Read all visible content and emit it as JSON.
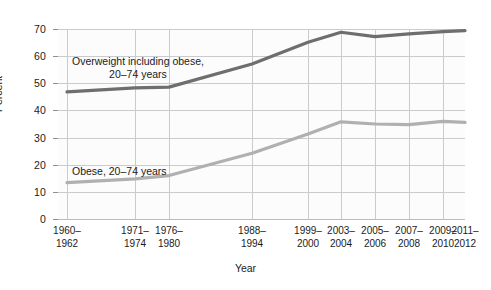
{
  "chart_data": {
    "type": "line",
    "title": "",
    "xlabel": "Year",
    "ylabel": "Percent",
    "ylim": [
      0,
      70
    ],
    "yticks": [
      0,
      10,
      20,
      30,
      40,
      50,
      60,
      70
    ],
    "grid": true,
    "legend_position": "inline-annotation",
    "categories": [
      "1960–\n1962",
      "1971–\n1974",
      "1976–\n1980",
      "1988–\n1994",
      "1999–\n2000",
      "2003–\n2004",
      "2005–\n2006",
      "2007–\n2008",
      "2009–\n2010",
      "2011–\n2012"
    ],
    "category_labels": [
      {
        "top": "1960–",
        "bottom": "1962"
      },
      {
        "top": "1971–",
        "bottom": "1974"
      },
      {
        "top": "1976–",
        "bottom": "1980"
      },
      {
        "top": "1988–",
        "bottom": "1994"
      },
      {
        "top": "1999–",
        "bottom": "2000"
      },
      {
        "top": "2003–",
        "bottom": "2004"
      },
      {
        "top": "2005–",
        "bottom": "2006"
      },
      {
        "top": "2007–",
        "bottom": "2008"
      },
      {
        "top": "2009–",
        "bottom": "2010"
      },
      {
        "top": "2011–",
        "bottom": "2012"
      }
    ],
    "series": [
      {
        "name": "Overweight including obese, 20–74 years",
        "color": "#6e6e6e",
        "values": [
          46.8,
          48.3,
          48.6,
          57.1,
          65.1,
          68.8,
          67.2,
          68.2,
          69.0,
          69.4
        ]
      },
      {
        "name": "Obese, 20–74 years",
        "color": "#b0b0b0",
        "values": [
          13.4,
          14.8,
          16.0,
          24.2,
          31.3,
          35.8,
          35.0,
          34.8,
          36.0,
          35.6
        ]
      }
    ],
    "annotations": [
      {
        "id": "overweight",
        "line1": "Overweight including obese,",
        "line2": "20–74 years"
      },
      {
        "id": "obese",
        "line1": "Obese, 20–74 years",
        "line2": ""
      }
    ]
  },
  "colors": {
    "overweight_line": "#6e6e6e",
    "obese_line": "#b0b0b0",
    "grid": "#c9cbcd",
    "text": "#1b1b1b",
    "plot_background": "#fcfcfc",
    "page_background": "#ffffff"
  }
}
